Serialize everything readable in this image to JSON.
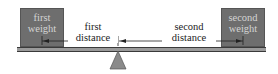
{
  "diagram": {
    "type": "lever-balance",
    "weights": [
      {
        "line1": "first",
        "line2": "weight"
      },
      {
        "line1": "second",
        "line2": "weight"
      }
    ],
    "distances": [
      {
        "line1": "first",
        "line2": "distance"
      },
      {
        "line1": "second",
        "line2": "distance"
      }
    ],
    "colors": {
      "weight_fill": "#6e6e6e",
      "weight_text": "#d4d4d4",
      "beam": "#9a9a9a",
      "fulcrum": "#888888",
      "arrow": "#222222"
    }
  }
}
